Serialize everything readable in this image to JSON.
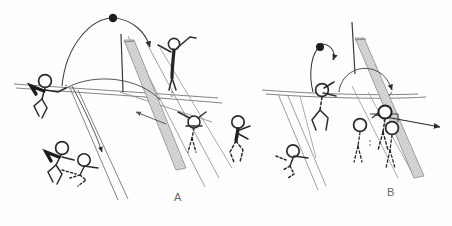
{
  "figure": {
    "type": "hand-drawn volleyball tactics diagram",
    "panel_count": 2,
    "background_color": "#ffffff",
    "ink_color": "#2b2b2b",
    "light_ink_color": "#8a8a8a",
    "net_fill_color": "#b9b9b9",
    "panels": [
      {
        "id": "A",
        "label": "A",
        "label_x": 174,
        "label_y": 191,
        "description": "Attack play: ball arcs over the net toward the blocking side",
        "court_lines": 2,
        "players": 6,
        "ball_count": 1,
        "net_present": true,
        "trajectory_arrows": 3
      },
      {
        "id": "B",
        "label": "B",
        "label_x": 387,
        "label_y": 186,
        "description": "Block play: three blockers at the net, ball deflected sideways",
        "court_lines": 2,
        "players": 5,
        "ball_count": 1,
        "net_present": true,
        "trajectory_arrows": 3
      }
    ],
    "elements": {
      "ball_a": {
        "x": 113,
        "y": 18,
        "r": 4.2,
        "color": "#1c1c1c"
      },
      "ball_b": {
        "x": 320,
        "y": 47,
        "r": 4.0,
        "color": "#1c1c1c"
      }
    }
  },
  "labels": {
    "panel_a": "A",
    "panel_b": "B"
  }
}
